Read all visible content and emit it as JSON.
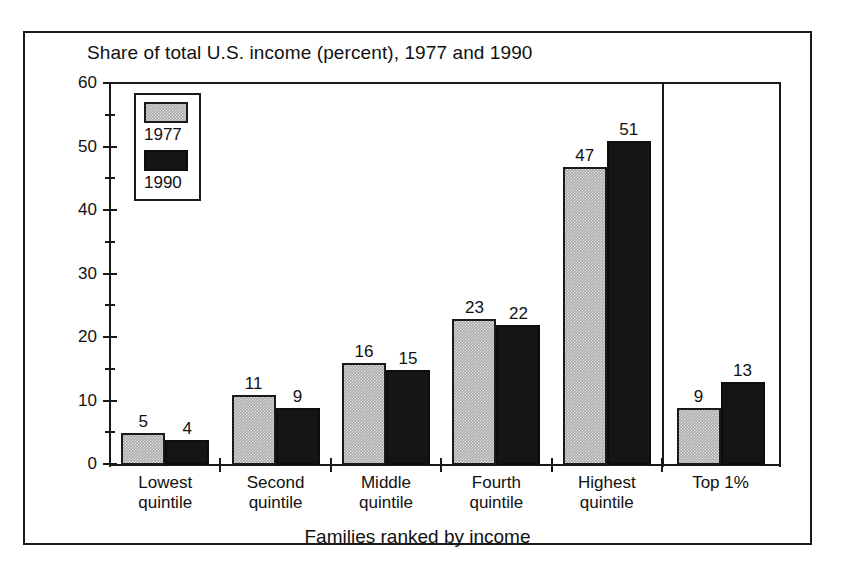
{
  "chart_data": {
    "type": "bar",
    "title": "Share of total U.S. income (percent), 1977 and 1990",
    "xlabel": "Families ranked by income",
    "ylabel": "",
    "categories": [
      "Lowest quintile",
      "Second quintile",
      "Middle quintile",
      "Fourth quintile",
      "Highest quintile",
      "Top 1%"
    ],
    "category_lines": [
      [
        "Lowest",
        "quintile"
      ],
      [
        "Second",
        "quintile"
      ],
      [
        "Middle",
        "quintile"
      ],
      [
        "Fourth",
        "quintile"
      ],
      [
        "Highest",
        "quintile"
      ],
      [
        "Top 1%",
        ""
      ]
    ],
    "series": [
      {
        "name": "1977",
        "color": "#ababab",
        "values": [
          5,
          11,
          16,
          23,
          47,
          9
        ]
      },
      {
        "name": "1990",
        "color": "#151515",
        "values": [
          4,
          9,
          15,
          22,
          51,
          13
        ]
      }
    ],
    "ylim": [
      0,
      60
    ],
    "y_major_ticks": [
      0,
      10,
      20,
      30,
      40,
      50,
      60
    ],
    "y_minor_ticks": [
      5,
      15,
      25,
      35,
      45,
      55
    ],
    "y_tick_labels": [
      "0",
      "10",
      "20",
      "30",
      "40",
      "50",
      "60"
    ],
    "grid": false,
    "legend_position": "top-left",
    "legend_entries": [
      "1977",
      "1990"
    ],
    "annotations": [
      "vertical divider separating the Top 1% group from the quintile groups"
    ]
  }
}
